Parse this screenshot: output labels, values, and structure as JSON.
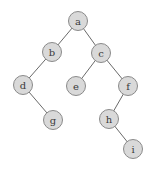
{
  "diagram": {
    "type": "binary-tree",
    "nodes": [
      {
        "id": "a",
        "label": "a"
      },
      {
        "id": "b",
        "label": "b"
      },
      {
        "id": "c",
        "label": "c"
      },
      {
        "id": "d",
        "label": "d"
      },
      {
        "id": "e",
        "label": "e"
      },
      {
        "id": "f",
        "label": "f"
      },
      {
        "id": "g",
        "label": "g"
      },
      {
        "id": "h",
        "label": "h"
      },
      {
        "id": "i",
        "label": "i"
      }
    ],
    "edges": [
      {
        "from": "a",
        "to": "b"
      },
      {
        "from": "a",
        "to": "c"
      },
      {
        "from": "b",
        "to": "d"
      },
      {
        "from": "c",
        "to": "e"
      },
      {
        "from": "c",
        "to": "f"
      },
      {
        "from": "d",
        "to": "g"
      },
      {
        "from": "f",
        "to": "h"
      },
      {
        "from": "h",
        "to": "i"
      }
    ],
    "colors": {
      "node_fill": "#d9d9d9",
      "node_stroke": "#8a8a8a",
      "edge": "#6a6a6a",
      "label": "#3a3a3a"
    }
  }
}
